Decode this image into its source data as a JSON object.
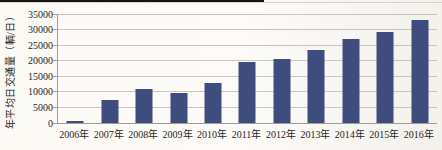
{
  "scan": {
    "background": "#fbfaf6",
    "top_edge_artifact_color": "#17140f",
    "top_edge_line_color": "#d7d3ca"
  },
  "chart_data": {
    "type": "bar",
    "title": "",
    "categories": [
      "2006年",
      "2007年",
      "2008年",
      "2009年",
      "2010年",
      "2011年",
      "2012年",
      "2013年",
      "2014年",
      "2015年",
      "2016年"
    ],
    "values": [
      700,
      7400,
      10800,
      9600,
      13000,
      19600,
      20500,
      23500,
      27000,
      29200,
      33200
    ],
    "xlabel": "",
    "ylabel": "年平均日交通量（輌/日）",
    "ylim": [
      0,
      35000
    ],
    "yticks": [
      0,
      5000,
      10000,
      15000,
      20000,
      25000,
      30000,
      35000
    ],
    "grid": true,
    "legend": false,
    "bar_color": "#3e4d7e",
    "gridline_color": "#c8c5be",
    "axis_color": "#a09d94",
    "text_color": "#2a2721"
  }
}
